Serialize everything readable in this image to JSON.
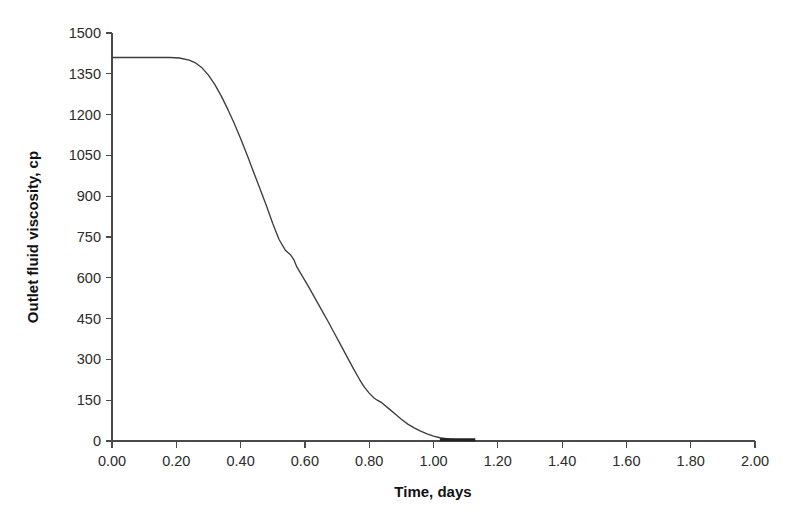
{
  "chart_data": {
    "type": "line",
    "title": "",
    "xlabel": "Time, days",
    "ylabel": "Outlet fluid viscosity, cp",
    "xlim": [
      0.0,
      2.0
    ],
    "ylim": [
      0,
      1500
    ],
    "grid": false,
    "legend": null,
    "x_ticks": [
      "0.00",
      "0.20",
      "0.40",
      "0.60",
      "0.80",
      "1.00",
      "1.20",
      "1.40",
      "1.60",
      "1.80",
      "2.00"
    ],
    "x_tick_values": [
      0.0,
      0.2,
      0.4,
      0.6,
      0.8,
      1.0,
      1.2,
      1.4,
      1.6,
      1.8,
      2.0
    ],
    "y_ticks": [
      "0",
      "150",
      "300",
      "450",
      "600",
      "750",
      "900",
      "1050",
      "1200",
      "1350",
      "1500"
    ],
    "y_tick_values": [
      0,
      150,
      300,
      450,
      600,
      750,
      900,
      1050,
      1200,
      1350,
      1500
    ],
    "series": [
      {
        "name": "Outlet fluid viscosity",
        "color": "#3d3d3d",
        "x": [
          0.0,
          0.03,
          0.06,
          0.09,
          0.12,
          0.15,
          0.18,
          0.21,
          0.24,
          0.26,
          0.28,
          0.3,
          0.32,
          0.34,
          0.36,
          0.38,
          0.4,
          0.42,
          0.44,
          0.46,
          0.48,
          0.5,
          0.52,
          0.54,
          0.555,
          0.565,
          0.575,
          0.59,
          0.61,
          0.63,
          0.65,
          0.67,
          0.69,
          0.71,
          0.73,
          0.75,
          0.77,
          0.785,
          0.8,
          0.815,
          0.825,
          0.84,
          0.86,
          0.88,
          0.9,
          0.92,
          0.94,
          0.96,
          0.98,
          1.0,
          1.02,
          1.05,
          1.08,
          1.1,
          1.13
        ],
        "y": [
          1410,
          1410,
          1410,
          1410,
          1410,
          1410,
          1410,
          1408,
          1400,
          1390,
          1372,
          1345,
          1310,
          1268,
          1220,
          1168,
          1112,
          1052,
          990,
          928,
          866,
          800,
          740,
          700,
          685,
          668,
          640,
          610,
          570,
          528,
          486,
          444,
          400,
          356,
          312,
          268,
          226,
          198,
          176,
          158,
          150,
          140,
          120,
          100,
          80,
          62,
          48,
          36,
          26,
          18,
          12,
          7,
          4,
          2,
          1
        ]
      }
    ],
    "annotations": [
      {
        "label": "plateau",
        "x_start": 0.0,
        "x_end": 0.26,
        "value": 1410
      },
      {
        "label": "shoulder",
        "x": 0.81,
        "value": 158
      },
      {
        "label": "data-end",
        "x": 1.13,
        "value": 0
      }
    ]
  },
  "axis": {
    "x_title": "Time, days",
    "y_title": "Outlet fluid viscosity, cp"
  }
}
